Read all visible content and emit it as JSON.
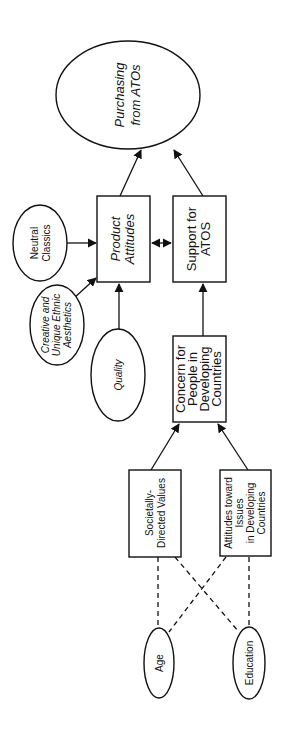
{
  "diagram": {
    "orientation": "rotated 90° counter-clockwise (text reads bottom-to-top)",
    "nodes": {
      "purchasing": {
        "line1": "Purchasing",
        "line2": "from ATOs",
        "shape": "ellipse",
        "italic": true
      },
      "neutral_classics": {
        "line1": "Neutral",
        "line2": "Classics",
        "shape": "ellipse",
        "italic": false
      },
      "creative": {
        "line1": "Creative and",
        "line2": "Unique Ethnic",
        "line3": "Aesthetics",
        "shape": "ellipse",
        "italic": true
      },
      "quality": {
        "line1": "Quality",
        "shape": "ellipse",
        "italic": true
      },
      "product_attitudes": {
        "line1": "Product",
        "line2": "Attitudes",
        "shape": "rect",
        "italic": true
      },
      "support_atos": {
        "line1": "Support for",
        "line2": "ATOS",
        "shape": "rect",
        "italic": false
      },
      "concern": {
        "line1": "Concern for",
        "line2": "People in",
        "line3": "Developing",
        "line4": "Countries",
        "shape": "rect",
        "italic": false
      },
      "societally": {
        "line1": "Societally-",
        "line2": "Directed Values",
        "shape": "rect",
        "italic": false
      },
      "attitudes_issues": {
        "line1": "Attitudes toward",
        "line2": "Issues",
        "line3": "in Developing",
        "line4": "Countries",
        "shape": "rect",
        "italic": false
      },
      "age": {
        "line1": "Age",
        "shape": "ellipse",
        "italic": false
      },
      "education": {
        "line1": "Education",
        "shape": "ellipse",
        "italic": false
      }
    },
    "edges": [
      {
        "from": "Product Attitudes",
        "to": "Purchasing from ATOs",
        "style": "solid-arrow"
      },
      {
        "from": "Support for ATOS",
        "to": "Purchasing from ATOs",
        "style": "solid-arrow"
      },
      {
        "from": "Neutral Classics",
        "to": "Product Attitudes",
        "style": "solid-arrow"
      },
      {
        "from": "Creative and Unique Ethnic Aesthetics",
        "to": "Product Attitudes",
        "style": "solid-arrow"
      },
      {
        "from": "Quality",
        "to": "Product Attitudes",
        "style": "solid-arrow"
      },
      {
        "from": "Product Attitudes",
        "to": "Support for ATOS",
        "style": "double-arrow"
      },
      {
        "from": "Concern for People in Developing Countries",
        "to": "Support for ATOS",
        "style": "solid-arrow"
      },
      {
        "from": "Societally-Directed Values",
        "to": "Concern for People in Developing Countries",
        "style": "solid-arrow"
      },
      {
        "from": "Attitudes toward Issues in Developing Countries",
        "to": "Concern for People in Developing Countries",
        "style": "solid-arrow"
      },
      {
        "from": "Age",
        "to": "Societally-Directed Values",
        "style": "dashed"
      },
      {
        "from": "Age",
        "to": "Attitudes toward Issues in Developing Countries",
        "style": "dashed"
      },
      {
        "from": "Education",
        "to": "Societally-Directed Values",
        "style": "dashed"
      },
      {
        "from": "Education",
        "to": "Attitudes toward Issues in Developing Countries",
        "style": "dashed"
      }
    ]
  }
}
